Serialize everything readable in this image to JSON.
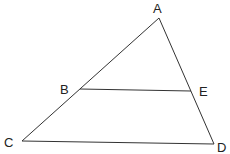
{
  "diagram": {
    "type": "triangle-with-parallel-segment",
    "points": {
      "A": {
        "label": "A",
        "x": 159,
        "y": 18,
        "lx": 153,
        "ly": 13
      },
      "B": {
        "label": "B",
        "x": 80,
        "y": 89,
        "lx": 60,
        "ly": 94
      },
      "C": {
        "label": "C",
        "x": 22,
        "y": 141,
        "lx": 4,
        "ly": 147
      },
      "D": {
        "label": "D",
        "x": 214,
        "y": 144,
        "lx": 217,
        "ly": 152
      },
      "E": {
        "label": "E",
        "x": 191,
        "y": 91,
        "lx": 199,
        "ly": 96
      }
    },
    "segments": [
      "AC",
      "AD",
      "CD",
      "BE"
    ],
    "stroke_color": "#333333"
  }
}
